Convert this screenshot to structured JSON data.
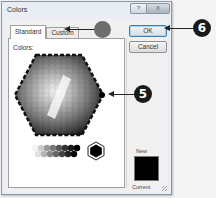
{
  "window": {
    "title": "Colors",
    "help_label": "?",
    "close_label": "X"
  },
  "tabs": [
    {
      "label": "Standard",
      "active": true
    },
    {
      "label": "Custom",
      "active": false
    }
  ],
  "panel": {
    "colors_label": "Colors:",
    "palette_style": "grayscale-hexagon",
    "selected_color": "#000000"
  },
  "buttons": {
    "ok_label": "OK",
    "cancel_label": "Cancel"
  },
  "preview": {
    "new_label": "New",
    "current_label": "Current",
    "new_color": "#000000"
  },
  "callouts": [
    {
      "label": "",
      "target": "custom-tab",
      "color": "#6d6d6d"
    },
    {
      "label": "6",
      "target": "ok-button",
      "color": "#1a1a1a"
    },
    {
      "label": "5",
      "target": "color-hexagon",
      "color": "#1a1a1a"
    }
  ]
}
